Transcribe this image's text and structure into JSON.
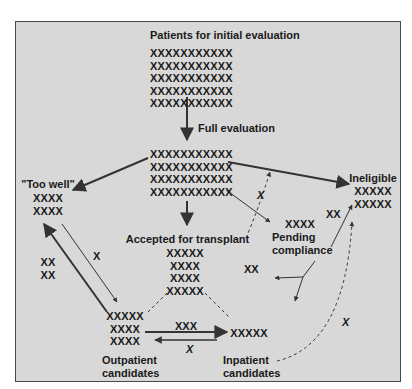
{
  "diagram": {
    "title": "Patients for initial evaluation",
    "nodes": {
      "initial": {
        "label": "Patients for initial evaluation",
        "marks": [
          "XXXXXXXXXXX",
          "XXXXXXXXXXX",
          "XXXXXXXXXXX",
          "XXXXXXXXXXX",
          "XXXXXXXXXXX"
        ]
      },
      "full_eval": {
        "label": "Full evaluation",
        "marks": [
          "XXXXXXXXXXX",
          "XXXXXXXXXXX",
          "XXXXXXXXXXX",
          "XXXXXXXXXXX"
        ]
      },
      "too_well": {
        "label": "\"Too well\"",
        "marks": [
          "XXXX",
          "XXXX"
        ]
      },
      "ineligible": {
        "label": "Ineligible",
        "marks": [
          "XXXXX",
          "XXXXX"
        ]
      },
      "accepted": {
        "label": "Accepted for transplant",
        "marks": [
          "XXXXX",
          "XXXX",
          "XXXX",
          "XXXXX"
        ]
      },
      "pending": {
        "label_line1": "Pending",
        "label_line2": "compliance",
        "marks": [
          "XXXX"
        ]
      },
      "outpatient": {
        "label_line1": "Outpatient",
        "label_line2": "candidates",
        "marks": [
          "XXXXX",
          "XXXX",
          "XXXX"
        ]
      },
      "inpatient": {
        "label_line1": "Inpatient",
        "label_line2": "candidates",
        "marks": [
          "XXXXX"
        ]
      }
    },
    "edge_labels": {
      "pending_to_ineligible": "XX",
      "pending_split": "XX",
      "full_to_ineligible_dashed": "X",
      "too_well_to_outpatient": "X",
      "outpatient_to_too_well": [
        "XX",
        "XX"
      ],
      "outpatient_to_inpatient": "XXX",
      "inpatient_to_outpatient": "X",
      "inpatient_to_ineligible": "X"
    }
  }
}
